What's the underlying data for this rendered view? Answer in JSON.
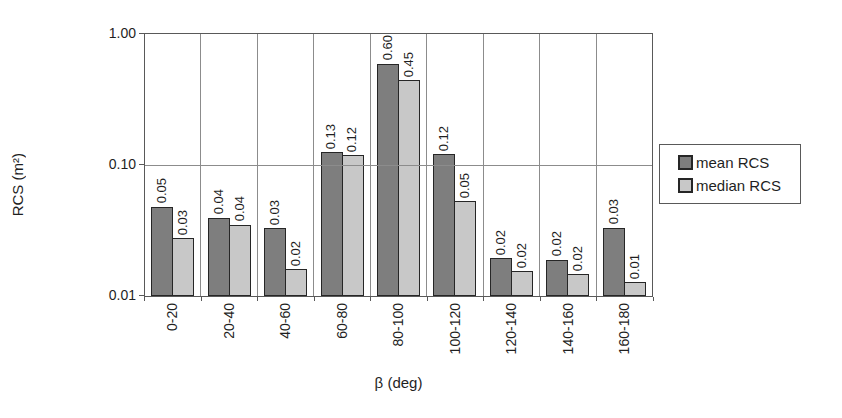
{
  "chart_data": {
    "type": "bar",
    "title": "",
    "xlabel": "β (deg)",
    "ylabel": "RCS (m²)",
    "y_scale": "log",
    "ylim": [
      0.01,
      1.0
    ],
    "y_ticks": [
      "1.00",
      "0.10",
      "0.01"
    ],
    "y_tick_values": [
      1.0,
      0.1,
      0.01
    ],
    "y_gridlines": [
      0.1
    ],
    "grid": "vertical category boundaries + horizontal major",
    "legend_position": "right",
    "categories": [
      "0-20",
      "20-40",
      "40-60",
      "60-80",
      "80-100",
      "100-120",
      "120-140",
      "140-160",
      "160-180"
    ],
    "series": [
      {
        "name": "mean RCS",
        "color": "#7e7e7e",
        "values": [
          0.05,
          0.04,
          0.03,
          0.13,
          0.6,
          0.12,
          0.02,
          0.02,
          0.03
        ],
        "labels": [
          "0.05",
          "0.04",
          "0.03",
          "0.13",
          "0.60",
          "0.12",
          "0.02",
          "0.02",
          "0.03"
        ],
        "values_est_precise": [
          0.048,
          0.0397,
          0.033,
          0.126,
          0.593,
          0.121,
          0.0195,
          0.0189,
          0.0333
        ]
      },
      {
        "name": "median RCS",
        "color": "#c8c8c8",
        "values": [
          0.03,
          0.04,
          0.02,
          0.12,
          0.45,
          0.05,
          0.02,
          0.02,
          0.01
        ],
        "labels": [
          "0.03",
          "0.04",
          "0.02",
          "0.12",
          "0.45",
          "0.05",
          "0.02",
          "0.02",
          "0.01"
        ],
        "values_est_precise": [
          0.0277,
          0.035,
          0.0161,
          0.119,
          0.443,
          0.0532,
          0.0154,
          0.0146,
          0.0127
        ]
      }
    ],
    "colors": {
      "plot_border": "#595959",
      "gridline": "#8c8c8c",
      "bar_border": "#262626",
      "text": "#1f1f1f",
      "background": "#ffffff"
    }
  },
  "legend": {
    "items": [
      {
        "label": "mean RCS"
      },
      {
        "label": "median RCS"
      }
    ]
  }
}
